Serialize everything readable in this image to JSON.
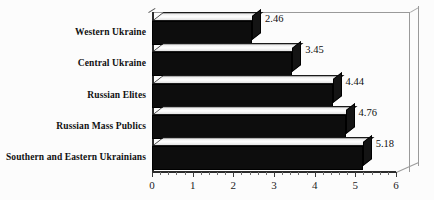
{
  "chart_data": {
    "type": "bar",
    "orientation": "horizontal",
    "style": "3d-extruded",
    "title": "",
    "subtitle": "",
    "xlabel": "",
    "ylabel": "",
    "categories": [
      "Western Ukraine",
      "Central Ukraine",
      "Russian Elites",
      "Russian Mass Publics",
      "Southern and Eastern Ukrainians"
    ],
    "values": [
      2.46,
      3.45,
      4.44,
      4.76,
      5.18
    ],
    "value_labels": [
      "2.46",
      "3.45",
      "4.44",
      "4.76",
      "5.18"
    ],
    "xlim": [
      0,
      6
    ],
    "xticks": [
      0,
      1,
      2,
      3,
      4,
      5,
      6
    ],
    "xtick_labels": [
      "0",
      "1",
      "2",
      "3",
      "4",
      "5",
      "6"
    ],
    "grid": false,
    "legend": null,
    "legend_position": "none",
    "colors": {
      "bar_front": "#0d0d0d",
      "bar_top": "#ffffff",
      "bar_side": "#141414",
      "axis": "#2b2b2b",
      "frame": "#9a9a9a",
      "background": "#fcfcfc",
      "text": "#111111"
    }
  }
}
